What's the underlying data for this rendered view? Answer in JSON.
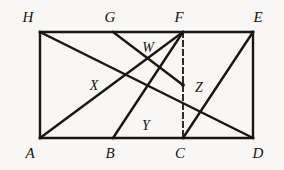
{
  "figure": {
    "background_color": "#f8f7f5",
    "stroke_color": "#18170f",
    "label_color": "#16150f",
    "solid_stroke_width": 2.4,
    "thin_stroke_width": 1.8,
    "dash_pattern": "5,4",
    "width": 284,
    "height": 170
  },
  "labels": {
    "H": "H",
    "G": "G",
    "F": "F",
    "E": "E",
    "W": "W",
    "X": "X",
    "Z": "Z",
    "Y": "Y",
    "A": "A",
    "B": "B",
    "C": "C",
    "D": "D"
  },
  "chart_data": {
    "type": "diagram",
    "subtype": "euclidean-geometry",
    "coordinate_space": {
      "units": "pixels",
      "origin": "top-left",
      "width": 284,
      "height": 170
    },
    "points": [
      {
        "name": "H",
        "x": 40,
        "y": 32,
        "role": "rectangle-corner",
        "label_x": 28,
        "label_y": 17
      },
      {
        "name": "G",
        "x": 113,
        "y": 32,
        "role": "top-edge-point",
        "label_x": 110,
        "label_y": 17
      },
      {
        "name": "F",
        "x": 183,
        "y": 32,
        "role": "top-edge-point",
        "label_x": 179,
        "label_y": 17
      },
      {
        "name": "E",
        "x": 253,
        "y": 32,
        "role": "rectangle-corner",
        "label_x": 258,
        "label_y": 17
      },
      {
        "name": "A",
        "x": 40,
        "y": 138,
        "role": "rectangle-corner",
        "label_x": 30,
        "label_y": 153
      },
      {
        "name": "B",
        "x": 113,
        "y": 138,
        "role": "bottom-edge-point",
        "label_x": 110,
        "label_y": 153
      },
      {
        "name": "C",
        "x": 183,
        "y": 138,
        "role": "bottom-edge-point",
        "label_x": 180,
        "label_y": 153
      },
      {
        "name": "D",
        "x": 253,
        "y": 138,
        "role": "rectangle-corner",
        "label_x": 258,
        "label_y": 153
      },
      {
        "name": "W",
        "x": 155,
        "y": 60,
        "role": "intersection",
        "label_x": 148,
        "label_y": 48
      },
      {
        "name": "X",
        "x": 110,
        "y": 85,
        "role": "intersection",
        "label_x": 94,
        "label_y": 86
      },
      {
        "name": "Z",
        "x": 183,
        "y": 85,
        "role": "intersection",
        "label_x": 199,
        "label_y": 88
      },
      {
        "name": "Y",
        "x": 148,
        "y": 112,
        "role": "intersection",
        "label_x": 146,
        "label_y": 126
      }
    ],
    "segments": [
      {
        "from": "H",
        "to": "E",
        "style": "solid",
        "kind": "rectangle-top"
      },
      {
        "from": "A",
        "to": "D",
        "style": "solid",
        "kind": "rectangle-bottom"
      },
      {
        "from": "H",
        "to": "A",
        "style": "solid",
        "kind": "rectangle-left"
      },
      {
        "from": "E",
        "to": "D",
        "style": "solid",
        "kind": "rectangle-right"
      },
      {
        "from": "H",
        "to": "D",
        "style": "solid",
        "kind": "diagonal",
        "passes_through": [
          "X",
          "Y",
          "Z"
        ]
      },
      {
        "from": "A",
        "to": "F",
        "style": "solid",
        "kind": "chord",
        "passes_through": [
          "X",
          "W"
        ]
      },
      {
        "from": "B",
        "to": "F",
        "style": "solid",
        "kind": "chord",
        "passes_through": [
          "Y"
        ]
      },
      {
        "from": "G",
        "to": "Z",
        "style": "solid",
        "kind": "chord",
        "passes_through": [
          "W"
        ]
      },
      {
        "from": "C",
        "to": "E",
        "style": "solid",
        "kind": "chord",
        "passes_through": [
          "Z"
        ]
      },
      {
        "from": "F",
        "to": "C",
        "style": "dashed",
        "kind": "vertical-dashed",
        "passes_through": [
          "Z"
        ]
      }
    ]
  }
}
